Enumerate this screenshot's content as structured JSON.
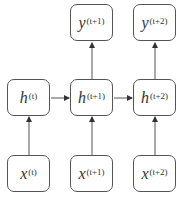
{
  "diagram": {
    "type": "recurrent-network-unrolled",
    "nodes": {
      "y1": {
        "base": "y",
        "sup": "(t+1)"
      },
      "y2": {
        "base": "y",
        "sup": "(t+2)"
      },
      "h0": {
        "base": "h",
        "sup": "(t)"
      },
      "h1": {
        "base": "h",
        "sup": "(t+1)"
      },
      "h2": {
        "base": "h",
        "sup": "(t+2)"
      },
      "x0": {
        "base": "x",
        "sup": "(t)"
      },
      "x1": {
        "base": "x",
        "sup": "(t+1)"
      },
      "x2": {
        "base": "x",
        "sup": "(t+2)"
      }
    },
    "edges": [
      {
        "from": "x0",
        "to": "h0"
      },
      {
        "from": "x1",
        "to": "h1"
      },
      {
        "from": "x2",
        "to": "h2"
      },
      {
        "from": "h0",
        "to": "h1"
      },
      {
        "from": "h1",
        "to": "h2"
      },
      {
        "from": "h1",
        "to": "y1"
      },
      {
        "from": "h2",
        "to": "y2"
      }
    ],
    "colors": {
      "stroke": "#555555",
      "text": "#333333",
      "background": "#ffffff"
    }
  }
}
